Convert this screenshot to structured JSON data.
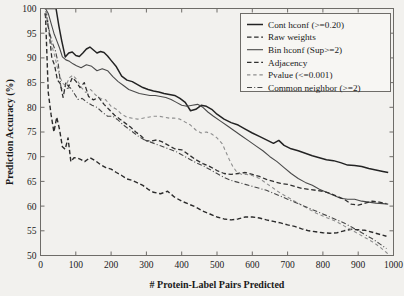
{
  "chart_data": {
    "type": "line",
    "title": "",
    "xlabel": "# Protein-Label Pairs Predicted",
    "ylabel": "Prediction Accuracy (%)",
    "xlim": [
      0,
      1000
    ],
    "ylim": [
      50,
      100
    ],
    "xticks": [
      0,
      100,
      200,
      300,
      400,
      500,
      600,
      700,
      800,
      900,
      1000
    ],
    "yticks": [
      50,
      55,
      60,
      65,
      70,
      75,
      80,
      85,
      90,
      95,
      100
    ],
    "grid": false,
    "legend_position": "top-right",
    "series": [
      {
        "name": "Cont hconf (>=0.20)",
        "style": "solid",
        "color": "#232323",
        "width": 1.5,
        "x": [
          12,
          20,
          28,
          36,
          44,
          52,
          60,
          70,
          80,
          90,
          100,
          110,
          120,
          130,
          140,
          150,
          160,
          170,
          180,
          190,
          200,
          215,
          230,
          245,
          260,
          275,
          290,
          305,
          320,
          335,
          350,
          365,
          380,
          395,
          410,
          425,
          440,
          455,
          470,
          485,
          500,
          520,
          540,
          560,
          580,
          600,
          620,
          640,
          660,
          675,
          690,
          710,
          730,
          750,
          770,
          790,
          810,
          830,
          850,
          870,
          890,
          910,
          930,
          950,
          970,
          985
        ],
        "y": [
          100,
          100,
          100,
          100,
          100,
          96.5,
          93.5,
          90.2,
          91.0,
          91.2,
          90.5,
          90.3,
          91.0,
          91.8,
          92.2,
          91.6,
          91.0,
          91.3,
          91.1,
          90.4,
          89.5,
          88.2,
          86.3,
          85.5,
          85.2,
          84.6,
          84.0,
          83.6,
          83.3,
          83.1,
          82.8,
          82.6,
          82.4,
          81.8,
          81.0,
          79.3,
          79.6,
          80.4,
          80.2,
          79.6,
          78.6,
          77.6,
          76.9,
          76.4,
          75.6,
          74.8,
          74.1,
          73.4,
          72.7,
          73.3,
          72.3,
          71.6,
          71.2,
          70.7,
          70.2,
          69.8,
          69.4,
          69.2,
          68.8,
          68.3,
          68.2,
          68.0,
          67.6,
          67.3,
          67.0,
          66.8
        ]
      },
      {
        "name": "Raw weights",
        "style": "dashed",
        "color": "#2b2b2b",
        "width": 1.4,
        "x": [
          14,
          22,
          30,
          38,
          46,
          54,
          62,
          70,
          78,
          86,
          95,
          105,
          115,
          125,
          140,
          155,
          170,
          185,
          200,
          215,
          230,
          245,
          260,
          275,
          290,
          305,
          320,
          340,
          360,
          380,
          400,
          420,
          440,
          460,
          480,
          500,
          520,
          540,
          560,
          580,
          600,
          620,
          640,
          660,
          680,
          700,
          720,
          740,
          760,
          780,
          800,
          820,
          840,
          860,
          880,
          900,
          920,
          940,
          960,
          980
        ],
        "y": [
          99.0,
          83.0,
          78.5,
          75.0,
          78.0,
          75.5,
          72.0,
          71.5,
          73.8,
          69.0,
          69.8,
          69.7,
          69.4,
          69.0,
          69.8,
          69.2,
          68.4,
          67.8,
          67.5,
          66.8,
          66.2,
          65.5,
          65.2,
          64.7,
          64.2,
          63.4,
          62.8,
          62.5,
          63.0,
          61.8,
          61.0,
          60.4,
          59.8,
          59.0,
          58.4,
          57.8,
          57.4,
          57.2,
          57.4,
          57.8,
          57.8,
          57.6,
          57.2,
          56.9,
          56.6,
          56.2,
          55.9,
          55.4,
          55.0,
          54.8,
          54.6,
          54.5,
          54.6,
          55.0,
          55.3,
          55.2,
          55.1,
          54.7,
          54.3,
          53.9
        ]
      },
      {
        "name": "Bin hconf (Sup>=2)",
        "style": "solid",
        "color": "#4a4a4a",
        "width": 1.1,
        "x": [
          14,
          22,
          30,
          38,
          46,
          54,
          62,
          72,
          82,
          92,
          102,
          115,
          130,
          145,
          160,
          175,
          190,
          205,
          220,
          235,
          250,
          265,
          280,
          295,
          310,
          325,
          340,
          355,
          370,
          385,
          400,
          415,
          430,
          445,
          460,
          475,
          490,
          510,
          530,
          550,
          570,
          590,
          610,
          630,
          650,
          670,
          690,
          710,
          730,
          750,
          770,
          790,
          810,
          830,
          850,
          870,
          890,
          910,
          930,
          950,
          970,
          985
        ],
        "y": [
          100,
          99.0,
          97.0,
          95.0,
          93.5,
          92.0,
          90.2,
          89.6,
          89.3,
          88.8,
          88.4,
          88.0,
          88.6,
          88.3,
          87.4,
          87.8,
          87.4,
          86.2,
          85.2,
          84.4,
          83.6,
          83.2,
          82.8,
          82.6,
          82.4,
          82.4,
          82.2,
          82.0,
          81.6,
          81.0,
          80.4,
          80.2,
          80.4,
          80.6,
          80.0,
          79.0,
          78.2,
          77.2,
          76.2,
          75.2,
          74.2,
          73.2,
          72.2,
          71.2,
          70.0,
          69.0,
          67.8,
          66.6,
          65.6,
          64.8,
          64.2,
          63.4,
          62.8,
          62.2,
          61.6,
          61.4,
          61.4,
          61.0,
          60.8,
          60.6,
          60.5,
          60.4
        ]
      },
      {
        "name": "Adjacency",
        "style": "dashed",
        "color": "#303030",
        "width": 1.3,
        "x": [
          16,
          24,
          32,
          40,
          48,
          56,
          64,
          72,
          80,
          90,
          100,
          112,
          124,
          136,
          150,
          165,
          180,
          195,
          210,
          225,
          240,
          255,
          270,
          285,
          300,
          315,
          330,
          345,
          360,
          380,
          400,
          420,
          440,
          460,
          480,
          500,
          520,
          540,
          560,
          580,
          600,
          620,
          640,
          660,
          680,
          700,
          720,
          740,
          760,
          780,
          800,
          820,
          840,
          860,
          880,
          900,
          920,
          940,
          960,
          980
        ],
        "y": [
          99.5,
          95.5,
          90.0,
          88.5,
          85.5,
          84.8,
          82.0,
          85.0,
          84.2,
          86.0,
          85.3,
          84.0,
          85.0,
          82.2,
          81.5,
          82.0,
          80.6,
          79.5,
          78.4,
          77.6,
          76.8,
          76.0,
          75.0,
          74.2,
          73.2,
          73.2,
          73.4,
          73.0,
          72.4,
          71.6,
          71.4,
          70.4,
          69.4,
          68.6,
          68.0,
          67.2,
          66.6,
          66.4,
          66.6,
          66.8,
          66.4,
          66.0,
          65.4,
          65.0,
          64.6,
          64.4,
          64.0,
          63.6,
          63.4,
          63.2,
          63.0,
          62.6,
          62.0,
          61.4,
          60.4,
          60.2,
          60.6,
          61.0,
          60.8,
          60.5
        ]
      },
      {
        "name": "Pvalue (<=0.001)",
        "style": "dashed-light",
        "color": "#8e8e8e",
        "width": 1.1,
        "x": [
          16,
          24,
          32,
          40,
          48,
          56,
          64,
          72,
          82,
          92,
          104,
          116,
          128,
          142,
          156,
          170,
          185,
          200,
          215,
          230,
          245,
          260,
          275,
          290,
          305,
          320,
          335,
          350,
          365,
          380,
          395,
          410,
          425,
          440,
          455,
          470,
          485,
          500,
          515,
          525,
          535,
          545,
          555,
          570,
          585,
          600,
          620,
          640,
          660,
          680,
          700,
          720,
          740,
          760,
          780,
          800,
          820,
          840,
          860,
          880,
          900,
          920,
          940,
          960,
          980,
          990
        ],
        "y": [
          99.5,
          96.0,
          92.5,
          90.5,
          88.0,
          86.0,
          84.8,
          84.4,
          86.0,
          86.5,
          85.5,
          84.0,
          83.0,
          83.6,
          82.5,
          81.8,
          81.5,
          80.2,
          79.6,
          78.6,
          78.0,
          77.8,
          77.6,
          77.8,
          78.0,
          78.2,
          78.2,
          78.0,
          77.8,
          77.8,
          77.6,
          77.0,
          76.4,
          75.4,
          74.8,
          75.0,
          74.6,
          73.8,
          72.6,
          71.0,
          69.4,
          68.0,
          67.0,
          66.4,
          66.4,
          66.2,
          65.6,
          64.6,
          63.6,
          62.6,
          61.8,
          61.0,
          60.2,
          59.4,
          58.6,
          58.0,
          57.4,
          56.8,
          56.0,
          55.2,
          54.4,
          53.6,
          52.8,
          51.8,
          50.6,
          50.0
        ]
      },
      {
        "name": "Common neighbor (>=2)",
        "style": "dashdot",
        "color": "#474747",
        "width": 1.1,
        "x": [
          12,
          18,
          26,
          34,
          42,
          50,
          58,
          66,
          74,
          84,
          94,
          106,
          118,
          132,
          146,
          160,
          175,
          190,
          205,
          220,
          235,
          250,
          265,
          280,
          295,
          310,
          325,
          340,
          355,
          370,
          385,
          400,
          420,
          440,
          460,
          480,
          500,
          520,
          540,
          560,
          580,
          600,
          620,
          640,
          660,
          680,
          700,
          720,
          740,
          760,
          780,
          800,
          820,
          840,
          860,
          880,
          900,
          920,
          940,
          960,
          980
        ],
        "y": [
          99.0,
          97.5,
          95.0,
          93.0,
          91.5,
          89.0,
          84.0,
          83.5,
          83.8,
          84.0,
          83.0,
          81.6,
          81.8,
          81.0,
          80.4,
          80.0,
          79.0,
          78.2,
          78.2,
          77.4,
          76.4,
          75.6,
          74.8,
          74.0,
          73.4,
          73.0,
          72.6,
          72.2,
          71.8,
          71.4,
          71.0,
          70.4,
          69.6,
          68.8,
          68.2,
          67.4,
          66.6,
          65.8,
          65.2,
          64.8,
          64.4,
          64.0,
          63.6,
          63.2,
          62.6,
          62.0,
          61.4,
          60.8,
          60.2,
          59.6,
          59.0,
          58.4,
          57.8,
          57.2,
          56.6,
          55.8,
          55.0,
          54.2,
          53.4,
          52.4,
          51.4
        ]
      }
    ]
  },
  "legend": {
    "items": [
      {
        "label": "Cont hconf (>=0.20)",
        "style": "solid"
      },
      {
        "label": "Raw weights",
        "style": "dashed"
      },
      {
        "label": "Bin hconf (Sup>=2)",
        "style": "solid"
      },
      {
        "label": "Adjacency",
        "style": "dashed"
      },
      {
        "label": "Pvalue (<=0.001)",
        "style": "dashed-light"
      },
      {
        "label": "Common neighbor (>=2)",
        "style": "dashdot"
      }
    ]
  },
  "colors": {
    "background": "#f2f1ee",
    "frame": "#6e6c68",
    "text": "#1a1a1a"
  }
}
